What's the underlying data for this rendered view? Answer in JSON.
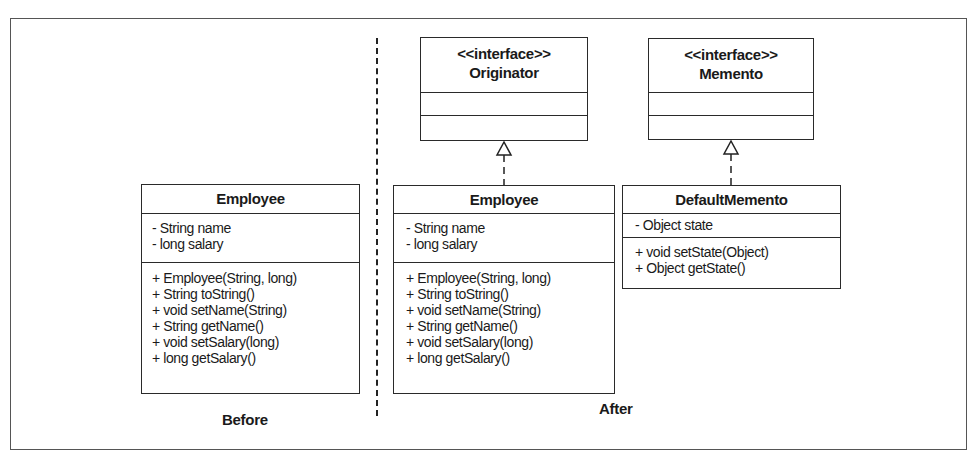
{
  "diagram": {
    "before": {
      "caption": "Before",
      "employee": {
        "name": "Employee",
        "attributes": [
          "-  String name",
          "-  long salary"
        ],
        "methods": [
          "+ Employee(String, long)",
          "+ String toString()",
          "+ void setName(String)",
          "+ String getName()",
          "+ void setSalary(long)",
          "+ long getSalary()"
        ]
      }
    },
    "after": {
      "caption": "After",
      "originator": {
        "stereotype": "<<interface>>",
        "name": "Originator"
      },
      "memento": {
        "stereotype": "<<interface>>",
        "name": "Memento"
      },
      "employee": {
        "name": "Employee",
        "attributes": [
          "-  String name",
          "-  long salary"
        ],
        "methods": [
          "+ Employee(String, long)",
          "+ String toString()",
          "+ void setName(String)",
          "+ String getName()",
          "+ void setSalary(long)",
          "+ long getSalary()"
        ]
      },
      "default_memento": {
        "name": "DefaultMemento",
        "attributes": [
          "-  Object state"
        ],
        "methods": [
          "+ void setState(Object)",
          "+ Object getState()"
        ]
      },
      "relations": [
        {
          "from": "Employee",
          "to": "Originator",
          "type": "realization"
        },
        {
          "from": "DefaultMemento",
          "to": "Memento",
          "type": "realization"
        }
      ]
    }
  }
}
